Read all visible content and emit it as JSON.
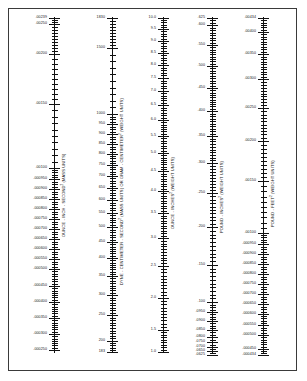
{
  "page": {
    "background": "#ffffff",
    "frame_color": "#3a3a3a",
    "ink_color": "#111111"
  },
  "chart_data": {
    "type": "table",
    "title": "",
    "subtitle": "",
    "xlabel": "",
    "ylabel": "",
    "grid": false,
    "legend_position": "none",
    "scales": [
      {
        "id": "ounce-inch-second2",
        "label": "OUNCE - INCH - SECOND² (MASS UNITS)",
        "axis_top_value": ".00239",
        "axis_bottom_value": ".000239",
        "labeled_ticks": [
          ".00239",
          ".00250",
          ".00200",
          ".00150",
          ".00100",
          ".000950",
          ".000900",
          ".000850",
          ".000800",
          ".000750",
          ".000700",
          ".000650",
          ".000600",
          ".000550",
          ".000500",
          ".000450",
          ".000400",
          ".000350",
          ".000300",
          ".000250"
        ]
      },
      {
        "id": "dyne-centimeter-second2",
        "label": "DYNE - CENTIMETER - SECOND² (MASS UNITS) OR GRAM - CENTIMETER² (WEIGHT UNITS)",
        "axis_top_value": "1830",
        "axis_bottom_value": "183",
        "labeled_ticks": [
          "1830",
          "1500",
          "1000",
          "950",
          "900",
          "850",
          "800",
          "750",
          "700",
          "650",
          "600",
          "550",
          "500",
          "450",
          "400",
          "350",
          "300",
          "250",
          "200",
          "183"
        ]
      },
      {
        "id": "ounce-inches2",
        "label": "OUNCE - INCHES² (WEIGHT UNITS)",
        "axis_top_value": "10.0",
        "axis_bottom_value": "1.0",
        "labeled_ticks": [
          "10.0",
          "9.5",
          "9.0",
          "8.5",
          "8.0",
          "7.5",
          "7.0",
          "6.5",
          "6.0",
          "5.5",
          "5.0",
          "4.5",
          "4.0",
          "3.5",
          "3.0",
          "2.5",
          "2.0",
          "1.5",
          "1.0"
        ]
      },
      {
        "id": "pound-inches2",
        "label": "POUND - INCHES² (WEIGHT UNITS)",
        "axis_top_value": ".625",
        "axis_bottom_value": ".0625",
        "labeled_ticks": [
          ".625",
          ".600",
          ".550",
          ".500",
          ".450",
          ".400",
          ".350",
          ".300",
          ".250",
          ".200",
          ".150",
          ".100",
          ".0950",
          ".0900",
          ".0850",
          ".0800",
          ".0750",
          ".0700",
          ".0650",
          ".0625"
        ]
      },
      {
        "id": "pound-feet2",
        "label": "POUND - FEET² (WEIGHT UNITS)",
        "axis_top_value": ".00434",
        "axis_bottom_value": ".000434",
        "labeled_ticks": [
          ".00434",
          ".00400",
          ".00350",
          ".00300",
          ".00250",
          ".00200",
          ".00150",
          ".00100",
          ".000950",
          ".000900",
          ".000850",
          ".000800",
          ".000750",
          ".000700",
          ".000650",
          ".000600",
          ".000550",
          ".000500",
          ".000450",
          ".000434"
        ]
      }
    ]
  },
  "layout": {
    "columns": [
      {
        "scale_index": 0,
        "axis_x": 54,
        "axis_top": 16,
        "axis_bottom": 352,
        "label_x": 60,
        "label_y": 236,
        "tick_labels": [
          {
            "text": ".00239",
            "y": 17
          },
          {
            "text": ".00250",
            "y": 23
          },
          {
            "text": ".00200",
            "y": 53
          },
          {
            "text": ".00150",
            "y": 103
          },
          {
            "text": ".00100",
            "y": 167
          },
          {
            "text": ".000950",
            "y": 178
          },
          {
            "text": ".000900",
            "y": 188
          },
          {
            "text": ".000850",
            "y": 198
          },
          {
            "text": ".000800",
            "y": 208
          },
          {
            "text": ".000750",
            "y": 218
          },
          {
            "text": ".000700",
            "y": 228
          },
          {
            "text": ".000650",
            "y": 238
          },
          {
            "text": ".000600",
            "y": 248
          },
          {
            "text": ".000550",
            "y": 258
          },
          {
            "text": ".000500",
            "y": 268
          },
          {
            "text": ".000450",
            "y": 285
          },
          {
            "text": ".000400",
            "y": 301
          },
          {
            "text": ".000350",
            "y": 317
          },
          {
            "text": ".000300",
            "y": 333
          },
          {
            "text": ".000250",
            "y": 349
          }
        ]
      },
      {
        "scale_index": 1,
        "axis_x": 112,
        "axis_top": 16,
        "axis_bottom": 352,
        "label_x": 118,
        "label_y": 284,
        "tick_labels": [
          {
            "text": "1830",
            "y": 17
          },
          {
            "text": "1500",
            "y": 47
          },
          {
            "text": "1000",
            "y": 113
          },
          {
            "text": "950",
            "y": 123
          },
          {
            "text": "900",
            "y": 133
          },
          {
            "text": "850",
            "y": 143
          },
          {
            "text": "800",
            "y": 153
          },
          {
            "text": "750",
            "y": 164
          },
          {
            "text": "700",
            "y": 175
          },
          {
            "text": "650",
            "y": 187
          },
          {
            "text": "600",
            "y": 199
          },
          {
            "text": "550",
            "y": 212
          },
          {
            "text": "500",
            "y": 226
          },
          {
            "text": "450",
            "y": 241
          },
          {
            "text": "400",
            "y": 257
          },
          {
            "text": "350",
            "y": 275
          },
          {
            "text": "300",
            "y": 294
          },
          {
            "text": "250",
            "y": 314
          },
          {
            "text": "200",
            "y": 340
          },
          {
            "text": "183",
            "y": 351
          }
        ]
      },
      {
        "scale_index": 2,
        "axis_x": 163,
        "axis_top": 16,
        "axis_bottom": 352,
        "label_x": 169,
        "label_y": 228,
        "tick_labels": [
          {
            "text": "10.0",
            "y": 17
          },
          {
            "text": "9.5",
            "y": 28
          },
          {
            "text": "9.0",
            "y": 40
          },
          {
            "text": "8.5",
            "y": 52
          },
          {
            "text": "8.0",
            "y": 64
          },
          {
            "text": "7.5",
            "y": 77
          },
          {
            "text": "7.0",
            "y": 90
          },
          {
            "text": "6.5",
            "y": 104
          },
          {
            "text": "6.0",
            "y": 119
          },
          {
            "text": "5.5",
            "y": 135
          },
          {
            "text": "5.0",
            "y": 152
          },
          {
            "text": "4.5",
            "y": 170
          },
          {
            "text": "4.0",
            "y": 190
          },
          {
            "text": "3.5",
            "y": 212
          },
          {
            "text": "3.0",
            "y": 237
          },
          {
            "text": "2.5",
            "y": 265
          },
          {
            "text": "2.0",
            "y": 297
          },
          {
            "text": "1.5",
            "y": 329
          },
          {
            "text": "1.0",
            "y": 351
          }
        ]
      },
      {
        "scale_index": 3,
        "axis_x": 212,
        "axis_top": 16,
        "axis_bottom": 352,
        "label_x": 218,
        "label_y": 232,
        "tick_labels": [
          {
            "text": ".625",
            "y": 17
          },
          {
            "text": ".600",
            "y": 24
          },
          {
            "text": ".550",
            "y": 44
          },
          {
            "text": ".500",
            "y": 65
          },
          {
            "text": ".450",
            "y": 87
          },
          {
            "text": ".400",
            "y": 110
          },
          {
            "text": ".350",
            "y": 135
          },
          {
            "text": ".300",
            "y": 162
          },
          {
            "text": ".250",
            "y": 192
          },
          {
            "text": ".200",
            "y": 226
          },
          {
            "text": ".150",
            "y": 264
          },
          {
            "text": ".100",
            "y": 301
          },
          {
            "text": ".0950",
            "y": 311
          },
          {
            "text": ".0900",
            "y": 320
          },
          {
            "text": ".0850",
            "y": 329
          },
          {
            "text": ".0800",
            "y": 336
          },
          {
            "text": ".0750",
            "y": 341
          },
          {
            "text": ".0700",
            "y": 346
          },
          {
            "text": ".0650",
            "y": 350
          },
          {
            "text": ".0625",
            "y": 354
          }
        ]
      },
      {
        "scale_index": 4,
        "axis_x": 263,
        "axis_top": 16,
        "axis_bottom": 352,
        "label_x": 269,
        "label_y": 226,
        "tick_labels": [
          {
            "text": ".00434",
            "y": 17
          },
          {
            "text": ".00400",
            "y": 31
          },
          {
            "text": ".00350",
            "y": 53
          },
          {
            "text": ".00300",
            "y": 78
          },
          {
            "text": ".00250",
            "y": 107
          },
          {
            "text": ".00200",
            "y": 140
          },
          {
            "text": ".00150",
            "y": 180
          },
          {
            "text": ".00100",
            "y": 232
          },
          {
            "text": ".000950",
            "y": 243
          },
          {
            "text": ".000900",
            "y": 253
          },
          {
            "text": ".000850",
            "y": 263
          },
          {
            "text": ".000800",
            "y": 273
          },
          {
            "text": ".000750",
            "y": 283
          },
          {
            "text": ".000700",
            "y": 293
          },
          {
            "text": ".000650",
            "y": 303
          },
          {
            "text": ".000600",
            "y": 313
          },
          {
            "text": ".000550",
            "y": 324
          },
          {
            "text": ".000500",
            "y": 334
          },
          {
            "text": ".000450",
            "y": 348
          },
          {
            "text": ".000434",
            "y": 354
          }
        ]
      }
    ]
  }
}
